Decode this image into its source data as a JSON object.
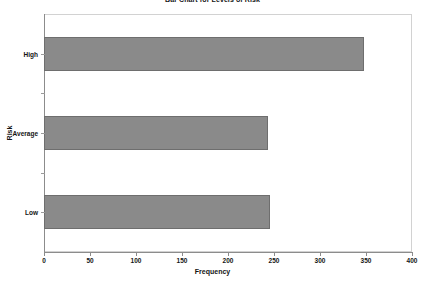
{
  "chart_data": {
    "type": "bar",
    "orientation": "horizontal",
    "title": "Bar Chart for Levels of Risk",
    "xlabel": "Frequency",
    "ylabel": "Risk",
    "categories": [
      "High",
      "Average",
      "Low"
    ],
    "values": [
      348,
      243,
      246
    ],
    "xlim": [
      0,
      400
    ],
    "xticks": [
      0,
      50,
      100,
      150,
      200,
      250,
      300,
      350,
      400
    ],
    "xtick_labels": [
      "0",
      "50",
      "100",
      "150",
      "200",
      "250",
      "300",
      "350",
      "400"
    ],
    "ytick_labels": [
      "High",
      "Average",
      "Low"
    ],
    "grid": false,
    "legend": null,
    "bar_color": "#8a8a8a",
    "bar_edge_color": "#6e6e6e",
    "axis_color": "#8c8c8c",
    "frame_color": "#d2d2d2",
    "background_color": "#ffffff",
    "series": [
      {
        "name": "Frequency",
        "values": [
          348,
          243,
          246
        ]
      }
    ]
  }
}
